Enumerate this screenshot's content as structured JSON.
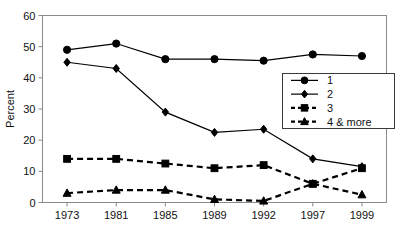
{
  "chart_data": {
    "type": "line",
    "title": "",
    "subtitle": "",
    "xlabel": "",
    "ylabel": "Percent",
    "categories": [
      "1973",
      "1981",
      "1985",
      "1989",
      "1992",
      "1997",
      "1999"
    ],
    "ylim": [
      0,
      60
    ],
    "yticks": [
      "0",
      "10",
      "20",
      "30",
      "40",
      "50",
      "60"
    ],
    "grid": false,
    "legend_position": "center-right",
    "series": [
      {
        "name": "1",
        "marker": "circle",
        "linestyle": "solid",
        "color": "#000000",
        "values": [
          49,
          51,
          46,
          46,
          45.5,
          47.5,
          47
        ]
      },
      {
        "name": "2",
        "marker": "diamond",
        "linestyle": "solid",
        "color": "#000000",
        "values": [
          45,
          43,
          29,
          22.5,
          23.5,
          14,
          11.5
        ]
      },
      {
        "name": "3",
        "marker": "square",
        "linestyle": "dashed",
        "color": "#000000",
        "values": [
          14,
          14,
          12.5,
          11,
          12,
          6,
          11
        ]
      },
      {
        "name": "4 & more",
        "marker": "triangle",
        "linestyle": "dashed",
        "color": "#000000",
        "values": [
          3,
          4,
          4,
          1,
          0.5,
          6,
          2.5
        ]
      }
    ]
  },
  "legend": {
    "entries": [
      {
        "label": "1"
      },
      {
        "label": "2"
      },
      {
        "label": "3"
      },
      {
        "label": "4 & more"
      }
    ]
  }
}
